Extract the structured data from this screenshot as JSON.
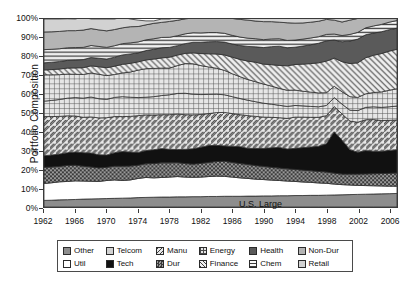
{
  "chart_data": {
    "type": "area",
    "title": "",
    "xlabel": "",
    "ylabel": "Portfolio Composition",
    "ylim": [
      0,
      100
    ],
    "xlim": [
      1962,
      2007
    ],
    "grid": false,
    "stacked": true,
    "legend_position": "bottom",
    "annotations": [
      {
        "text": "U.S. Large",
        "x": 1985,
        "y": 14
      }
    ],
    "ytick_labels": [
      "0%",
      "10%",
      "20%",
      "30%",
      "40%",
      "50%",
      "60%",
      "70%",
      "80%",
      "90%",
      "100%"
    ],
    "ytick_values": [
      0,
      10,
      20,
      30,
      40,
      50,
      60,
      70,
      80,
      90,
      100
    ],
    "xtick_labels": [
      "1962",
      "1966",
      "1970",
      "1974",
      "1978",
      "1982",
      "1986",
      "1990",
      "1994",
      "1998",
      "2002",
      "2006"
    ],
    "xtick_values": [
      1962,
      1966,
      1970,
      1974,
      1978,
      1982,
      1986,
      1990,
      1994,
      1998,
      2002,
      2006
    ],
    "x": [
      1962,
      1963,
      1964,
      1965,
      1966,
      1967,
      1968,
      1969,
      1970,
      1971,
      1972,
      1973,
      1974,
      1975,
      1976,
      1977,
      1978,
      1979,
      1980,
      1981,
      1982,
      1983,
      1984,
      1985,
      1986,
      1987,
      1988,
      1989,
      1990,
      1991,
      1992,
      1993,
      1994,
      1995,
      1996,
      1997,
      1998,
      1999,
      2000,
      2001,
      2002,
      2003,
      2004,
      2005,
      2006,
      2007
    ],
    "series": [
      {
        "name": "Other",
        "pattern": "solid-medium-gray",
        "color": "#8d8d8d",
        "values": [
          3.5,
          3.6,
          3.8,
          3.9,
          4.0,
          4.2,
          4.3,
          4.4,
          4.5,
          4.6,
          4.7,
          4.8,
          5.0,
          5.1,
          5.2,
          5.3,
          5.3,
          5.4,
          5.4,
          5.5,
          5.5,
          5.6,
          5.6,
          5.7,
          5.7,
          5.7,
          5.8,
          5.8,
          5.9,
          5.9,
          6.0,
          6.0,
          6.1,
          6.1,
          6.2,
          6.2,
          6.3,
          6.4,
          6.5,
          6.6,
          6.7,
          6.8,
          6.9,
          7.0,
          7.1,
          7.2
        ]
      },
      {
        "name": "Util",
        "pattern": "solid-white",
        "color": "#ffffff",
        "values": [
          9.0,
          9.3,
          9.6,
          9.7,
          9.9,
          9.6,
          9.4,
          9.2,
          9.6,
          9.8,
          9.4,
          9.6,
          10.2,
          10.6,
          10.3,
          10.4,
          10.6,
          10.8,
          10.5,
          10.3,
          10.4,
          10.6,
          10.8,
          10.6,
          10.2,
          9.8,
          9.4,
          9.0,
          8.7,
          8.4,
          8.1,
          7.8,
          7.5,
          7.2,
          6.9,
          6.6,
          6.3,
          5.8,
          5.4,
          5.1,
          4.8,
          4.6,
          4.4,
          4.2,
          4.0,
          3.9
        ]
      },
      {
        "name": "Dur",
        "pattern": "dense-checker",
        "color": "#7b7b7b",
        "values": [
          8.6,
          8.4,
          8.2,
          8.5,
          8.3,
          7.9,
          7.6,
          7.2,
          7.0,
          7.3,
          7.6,
          7.4,
          7.0,
          7.3,
          7.6,
          7.8,
          7.6,
          7.4,
          7.2,
          7.0,
          7.3,
          7.5,
          7.8,
          8.0,
          7.8,
          7.6,
          7.4,
          7.2,
          7.0,
          6.8,
          6.6,
          6.5,
          6.4,
          6.3,
          6.2,
          6.1,
          6.0,
          5.8,
          5.6,
          5.8,
          6.0,
          6.2,
          6.4,
          6.6,
          6.8,
          7.0
        ]
      },
      {
        "name": "Tech",
        "pattern": "solid-black",
        "color": "#111111",
        "values": [
          6.2,
          6.4,
          6.6,
          6.8,
          7.0,
          7.2,
          7.4,
          7.0,
          6.6,
          7.2,
          7.8,
          7.4,
          6.8,
          7.0,
          7.4,
          7.6,
          7.2,
          7.0,
          7.6,
          8.2,
          8.6,
          9.0,
          8.6,
          8.2,
          8.6,
          9.0,
          8.6,
          9.2,
          9.6,
          10.4,
          11.0,
          10.6,
          11.2,
          12.0,
          12.6,
          13.4,
          15.0,
          22.0,
          18.0,
          13.0,
          11.6,
          12.4,
          12.0,
          11.8,
          12.2,
          12.4
        ]
      },
      {
        "name": "Manu",
        "pattern": "back-hatch",
        "color": "#d4d4d4",
        "values": [
          20.8,
          20.4,
          20.0,
          19.6,
          19.2,
          18.8,
          19.2,
          19.6,
          19.8,
          19.2,
          18.6,
          19.0,
          19.6,
          19.0,
          18.4,
          18.0,
          18.4,
          18.8,
          18.4,
          18.0,
          17.4,
          17.0,
          17.4,
          17.8,
          17.4,
          17.0,
          17.4,
          17.0,
          16.6,
          16.2,
          15.8,
          16.2,
          16.6,
          16.2,
          15.8,
          15.4,
          15.0,
          13.4,
          14.0,
          15.2,
          16.0,
          16.4,
          16.8,
          16.4,
          16.0,
          15.8
        ]
      },
      {
        "name": "Dur2",
        "pattern": "grid-cross",
        "color": "#dcdcdc",
        "values": [
          8.2,
          8.6,
          9.0,
          9.4,
          9.8,
          10.2,
          10.6,
          10.2,
          9.8,
          10.2,
          10.6,
          10.2,
          9.6,
          9.4,
          9.8,
          10.2,
          10.6,
          11.0,
          11.4,
          11.0,
          10.6,
          10.2,
          9.8,
          9.4,
          9.0,
          8.6,
          8.2,
          7.8,
          7.4,
          7.0,
          6.6,
          6.4,
          6.2,
          6.0,
          5.8,
          5.6,
          5.4,
          4.8,
          5.2,
          5.8,
          6.2,
          6.6,
          6.8,
          7.0,
          7.2,
          7.4
        ]
      },
      {
        "name": "Energy",
        "pattern": "grid-cross",
        "color": "#dcdcdc",
        "values": [
          14.0,
          13.6,
          13.2,
          12.8,
          12.4,
          12.6,
          12.8,
          13.0,
          12.6,
          12.2,
          12.6,
          13.4,
          14.6,
          15.2,
          15.0,
          14.6,
          14.2,
          14.8,
          15.8,
          16.2,
          15.4,
          14.6,
          13.8,
          13.0,
          12.2,
          11.6,
          11.0,
          10.6,
          10.2,
          9.6,
          9.0,
          8.6,
          8.2,
          7.8,
          7.6,
          7.4,
          6.8,
          6.0,
          6.6,
          7.2,
          7.0,
          7.2,
          7.6,
          8.2,
          8.8,
          9.2
        ]
      },
      {
        "name": "Finance",
        "pattern": "fwd-hatch",
        "color": "#e2e2e2",
        "values": [
          2.6,
          2.8,
          3.0,
          3.2,
          3.4,
          3.6,
          3.8,
          4.0,
          4.2,
          4.4,
          4.6,
          4.6,
          4.4,
          4.6,
          5.0,
          5.4,
          5.8,
          5.6,
          5.4,
          5.8,
          6.4,
          7.0,
          7.6,
          8.2,
          8.8,
          9.2,
          9.8,
          10.4,
          10.6,
          11.4,
          12.2,
          13.0,
          13.6,
          14.4,
          15.2,
          16.0,
          16.8,
          15.0,
          16.0,
          17.6,
          18.4,
          19.2,
          19.8,
          20.4,
          20.8,
          21.0
        ]
      },
      {
        "name": "Health",
        "pattern": "solid-dark-gray",
        "color": "#5a5a5a",
        "values": [
          3.8,
          3.9,
          4.0,
          4.1,
          4.2,
          4.3,
          4.4,
          4.5,
          4.6,
          4.8,
          5.0,
          5.0,
          4.8,
          5.0,
          5.2,
          5.4,
          5.2,
          5.0,
          5.2,
          5.6,
          6.0,
          6.4,
          6.6,
          6.8,
          7.0,
          7.4,
          7.8,
          8.2,
          8.8,
          9.6,
          10.2,
          9.6,
          9.2,
          9.6,
          10.0,
          10.4,
          10.8,
          9.6,
          10.6,
          12.0,
          12.6,
          12.2,
          11.8,
          11.6,
          11.4,
          11.2
        ]
      },
      {
        "name": "Chem",
        "pattern": "horiz-lines",
        "color": "#ededed",
        "values": [
          7.0,
          6.9,
          6.8,
          6.7,
          6.6,
          6.5,
          6.4,
          6.3,
          6.2,
          6.1,
          6.0,
          5.9,
          5.8,
          5.7,
          5.6,
          5.5,
          5.4,
          5.3,
          5.2,
          5.1,
          5.0,
          4.9,
          4.8,
          4.7,
          4.6,
          4.5,
          4.4,
          4.3,
          4.2,
          4.1,
          4.0,
          3.9,
          3.8,
          3.7,
          3.6,
          3.5,
          3.4,
          3.2,
          3.3,
          3.5,
          3.6,
          3.7,
          3.8,
          3.9,
          4.0,
          4.1
        ]
      },
      {
        "name": "Non-Dur",
        "pattern": "solid-light-gray",
        "color": "#b4b4b4",
        "values": [
          9.4,
          9.3,
          9.2,
          9.1,
          9.0,
          9.2,
          9.0,
          8.8,
          8.8,
          8.6,
          8.4,
          8.6,
          8.2,
          8.0,
          8.2,
          8.0,
          8.4,
          8.2,
          8.0,
          7.8,
          8.0,
          8.2,
          8.4,
          8.6,
          9.0,
          9.4,
          9.6,
          9.4,
          9.6,
          9.2,
          8.8,
          9.4,
          9.0,
          8.6,
          8.4,
          8.2,
          8.0,
          7.4,
          7.2,
          7.6,
          7.4,
          7.0,
          6.8,
          6.6,
          6.4,
          6.2
        ]
      },
      {
        "name": "Retail",
        "pattern": "solid-pale-gray",
        "color": "#d2d2d2",
        "values": [
          6.9,
          6.8,
          6.6,
          6.3,
          6.2,
          6.9,
          5.1,
          5.8,
          6.3,
          5.6,
          5.7,
          4.1,
          3.4,
          2.1,
          1.3,
          1.8,
          1.3,
          1.7,
          1.5,
          1.5,
          1.4,
          1.0,
          3.8,
          5.0,
          6.7,
          8.2,
          8.6,
          8.1,
          8.4,
          8.4,
          9.7,
          9.0,
          10.2,
          8.1,
          7.7,
          7.2,
          6.2,
          6.6,
          7.6,
          6.1,
          3.1,
          0.7,
          3.0,
          2.3,
          3.3,
          2.6
        ]
      }
    ],
    "legend": [
      {
        "label": "Other",
        "pattern": "solid-medium-gray"
      },
      {
        "label": "Telcom",
        "pattern": "solid-pale-gray"
      },
      {
        "label": "Manu",
        "pattern": "back-hatch"
      },
      {
        "label": "Energy",
        "pattern": "grid-cross"
      },
      {
        "label": "Health",
        "pattern": "solid-dark-gray"
      },
      {
        "label": "Non-Dur",
        "pattern": "solid-light-gray"
      },
      {
        "label": "Util",
        "pattern": "solid-white"
      },
      {
        "label": "Tech",
        "pattern": "solid-black"
      },
      {
        "label": "Dur",
        "pattern": "dense-checker"
      },
      {
        "label": "Finance",
        "pattern": "fwd-hatch"
      },
      {
        "label": "Chem",
        "pattern": "horiz-lines"
      },
      {
        "label": "Retail",
        "pattern": "solid-pale-gray"
      }
    ]
  }
}
